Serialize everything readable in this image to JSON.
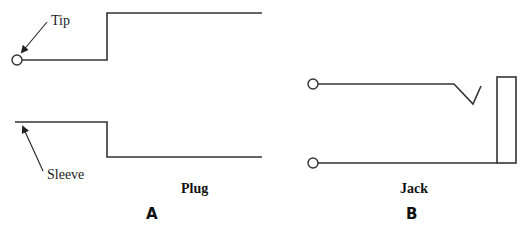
{
  "plug": {
    "caption": "Plug",
    "panel_letter": "A",
    "tip_label": "Tip",
    "sleeve_label": "Sleeve"
  },
  "jack": {
    "caption": "Jack",
    "panel_letter": "B"
  },
  "colors": {
    "line": "#333333",
    "background": "#ffffff"
  }
}
